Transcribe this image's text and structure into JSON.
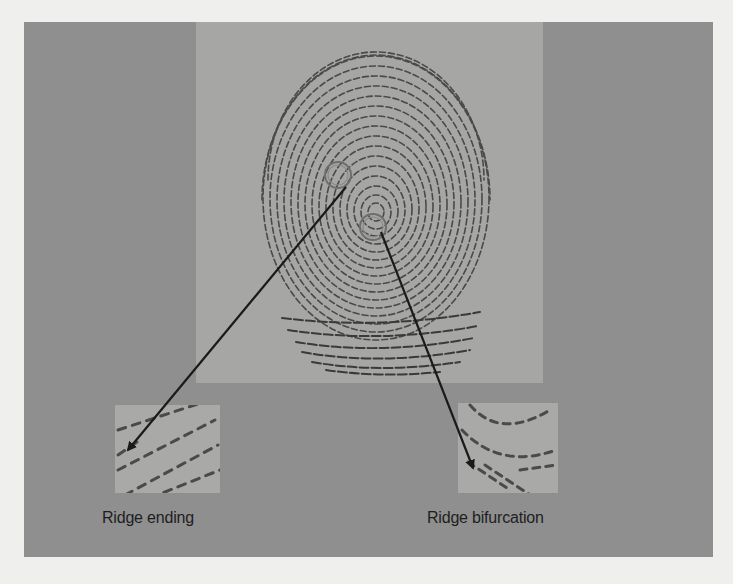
{
  "figure": {
    "colors": {
      "page_background": "#efefed",
      "frame": "#8f8f8f",
      "center_panel": "#a6a6a5",
      "inset": "#a9a9a8",
      "ridge": "#3a3a3a",
      "marker_ring": "#6e6e6e",
      "arrow": "#1a1a1a"
    },
    "markers": [
      {
        "name": "ridge-ending-marker",
        "cx": 338,
        "cy": 175,
        "r": 13
      },
      {
        "name": "ridge-bifurcation-marker",
        "cx": 373,
        "cy": 227,
        "r": 13
      }
    ],
    "arrows": [
      {
        "name": "ridge-ending-arrow",
        "x1": 346,
        "y1": 187,
        "x2": 128,
        "y2": 450
      },
      {
        "name": "ridge-bifurcation-arrow",
        "x1": 381,
        "y1": 232,
        "x2": 473,
        "y2": 468
      }
    ],
    "insets": [
      {
        "name": "ridge-ending-inset",
        "x": 115,
        "y": 405,
        "w": 105,
        "h": 88
      },
      {
        "name": "ridge-bifurcation-inset",
        "x": 458,
        "y": 403,
        "w": 100,
        "h": 90
      }
    ],
    "labels": {
      "ridge_ending": "Ridge ending",
      "ridge_bifurcation": "Ridge bifurcation"
    }
  }
}
